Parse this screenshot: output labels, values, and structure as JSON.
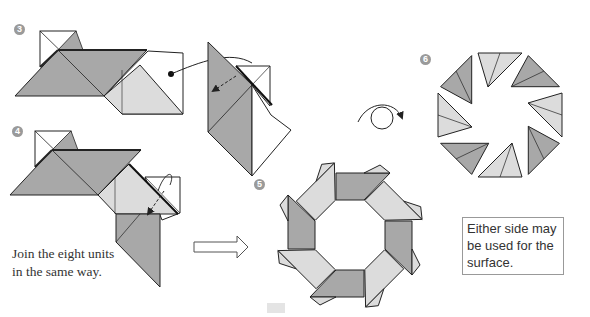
{
  "steps": [
    {
      "number": "3"
    },
    {
      "number": "4"
    },
    {
      "number": "5"
    },
    {
      "number": "6"
    }
  ],
  "notes": {
    "join_line1": "Join the eight units",
    "join_line2": "in the same way.",
    "either_side": "Either side may be used for the surface."
  },
  "colors": {
    "dark_fill": "#a8a8a8",
    "light_fill": "#dcdcdc",
    "white_fill": "#ffffff",
    "stroke": "#222222",
    "badge": "#9a9a9a"
  },
  "icons": {
    "turn_over": "turn-over-arrow",
    "next_step": "hollow-right-arrow",
    "fold_arrow": "dashed-fold-arrow"
  }
}
